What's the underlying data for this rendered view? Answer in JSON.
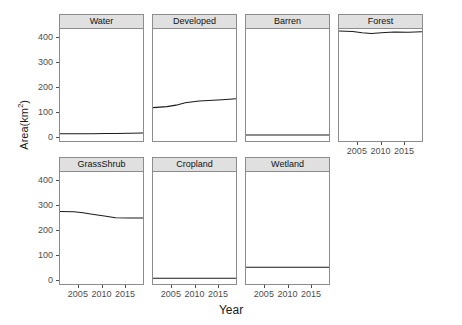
{
  "chart_data": {
    "type": "line",
    "title": "",
    "xlabel": "Year",
    "ylabel": "Area(km2)",
    "ylabel_display": "Area(km",
    "ylabel_sup": "2",
    "ylabel_tail": ")",
    "xlim": [
      2001,
      2019
    ],
    "ylim": [
      -20,
      430
    ],
    "grid": false,
    "legend": "none",
    "facet_layout": {
      "rows": 2,
      "cols": 4,
      "last_row_cols": 3
    },
    "xticks": [
      2005,
      2010,
      2015
    ],
    "xtick_labels": [
      "2005",
      "2010",
      "2015"
    ],
    "yticks": [
      0,
      100,
      200,
      300,
      400
    ],
    "ytick_labels": [
      "0",
      "100",
      "200",
      "300",
      "400"
    ],
    "x": [
      2001,
      2004,
      2006,
      2008,
      2011,
      2013,
      2016,
      2019
    ],
    "panels": [
      {
        "name": "Water",
        "label": "Water",
        "values": [
          9,
          9,
          9,
          9,
          10,
          10,
          11,
          12
        ]
      },
      {
        "name": "Developed",
        "label": "Developed",
        "values": [
          114,
          118,
          124,
          134,
          141,
          143,
          146,
          150
        ]
      },
      {
        "name": "Barren",
        "label": "Barren",
        "values": [
          4,
          4,
          4,
          4,
          4,
          4,
          4,
          4
        ]
      },
      {
        "name": "Forest",
        "label": "Forest",
        "values": [
          422,
          420,
          415,
          412,
          416,
          418,
          417,
          419
        ]
      },
      {
        "name": "GrassShrub",
        "label": "GrassShrub",
        "values": [
          271,
          270,
          266,
          260,
          252,
          246,
          245,
          245
        ]
      },
      {
        "name": "Cropland",
        "label": "Cropland",
        "values": [
          3,
          3,
          3,
          3,
          3,
          3,
          3,
          3
        ]
      },
      {
        "name": "Wetland",
        "label": "Wetland",
        "values": [
          47,
          47,
          47,
          47,
          47,
          47,
          47,
          47
        ]
      }
    ],
    "colors": {
      "line": "#1a1a1a",
      "strip_bg": "#e0e0e0",
      "panel_border": "#8c8c8c",
      "axis_text": "#4d4d4d",
      "background": "#ffffff"
    }
  }
}
